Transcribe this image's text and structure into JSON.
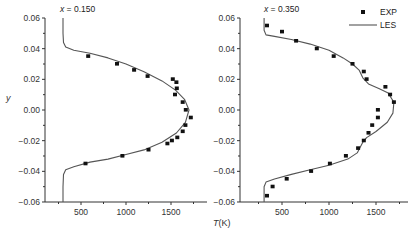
{
  "chart_data": [
    {
      "type": "line",
      "title": "x = 0.150",
      "title_italic_var": "x",
      "title_value": " = 0.150",
      "xlabel": "T(K)",
      "ylabel": "y",
      "xlim": [
        100,
        1900
      ],
      "ylim": [
        -0.06,
        0.06
      ],
      "xticks": [
        500,
        1000,
        1500
      ],
      "xtick_labels": [
        "500",
        "1000",
        "1500"
      ],
      "yticks": [
        0.06,
        0.04,
        0.02,
        0.0,
        -0.02,
        -0.04,
        -0.06
      ],
      "ytick_labels": [
        "0.06",
        "0.04",
        "0.02",
        "0.00",
        "−0.02",
        "−0.04",
        "−0.06"
      ],
      "grid": false,
      "series": [
        {
          "name": "EXP",
          "style": "square-markers",
          "points": [
            [
              580,
              0.035
            ],
            [
              900,
              0.03
            ],
            [
              1090,
              0.026
            ],
            [
              1240,
              0.022
            ],
            [
              1520,
              0.02
            ],
            [
              1560,
              0.018
            ],
            [
              1565,
              0.014
            ],
            [
              1545,
              0.01
            ],
            [
              1630,
              0.005
            ],
            [
              1665,
              0.0
            ],
            [
              1720,
              -0.005
            ],
            [
              1660,
              -0.01
            ],
            [
              1630,
              -0.014
            ],
            [
              1570,
              -0.018
            ],
            [
              1510,
              -0.02
            ],
            [
              1460,
              -0.022
            ],
            [
              1250,
              -0.026
            ],
            [
              960,
              -0.03
            ],
            [
              550,
              -0.035
            ]
          ]
        },
        {
          "name": "LES",
          "style": "solid-line",
          "points": [
            [
              300,
              0.06
            ],
            [
              300,
              0.05
            ],
            [
              305,
              0.044
            ],
            [
              330,
              0.041
            ],
            [
              420,
              0.039
            ],
            [
              600,
              0.037
            ],
            [
              800,
              0.034
            ],
            [
              1000,
              0.03
            ],
            [
              1200,
              0.025
            ],
            [
              1400,
              0.019
            ],
            [
              1550,
              0.013
            ],
            [
              1650,
              0.007
            ],
            [
              1700,
              0.0
            ],
            [
              1660,
              -0.008
            ],
            [
              1560,
              -0.015
            ],
            [
              1400,
              -0.021
            ],
            [
              1200,
              -0.026
            ],
            [
              1000,
              -0.029
            ],
            [
              800,
              -0.032
            ],
            [
              600,
              -0.034
            ],
            [
              420,
              -0.037
            ],
            [
              330,
              -0.039
            ],
            [
              305,
              -0.042
            ],
            [
              300,
              -0.05
            ],
            [
              300,
              -0.06
            ]
          ]
        }
      ]
    },
    {
      "type": "line",
      "title": "x = 0.350",
      "title_italic_var": "x",
      "title_value": " = 0.350",
      "xlabel": "T(K)",
      "ylabel": "y",
      "xlim": [
        100,
        1850
      ],
      "ylim": [
        -0.06,
        0.06
      ],
      "xticks": [
        500,
        1000,
        1500
      ],
      "xtick_labels": [
        "500",
        "1000",
        "1500"
      ],
      "yticks": [
        0.06,
        0.04,
        0.02,
        0.0,
        -0.02,
        -0.04,
        -0.06
      ],
      "ytick_labels": [
        "0.06",
        "0.04",
        "0.02",
        "0.00",
        "−0.02",
        "−0.04",
        "−0.06"
      ],
      "grid": false,
      "legend_position": "upper right",
      "series": [
        {
          "name": "EXP",
          "style": "square-markers",
          "points": [
            [
              340,
              0.055
            ],
            [
              500,
              0.051
            ],
            [
              650,
              0.045
            ],
            [
              870,
              0.04
            ],
            [
              1050,
              0.035
            ],
            [
              1250,
              0.03
            ],
            [
              1370,
              0.025
            ],
            [
              1400,
              0.02
            ],
            [
              1600,
              0.015
            ],
            [
              1650,
              0.01
            ],
            [
              1690,
              0.005
            ],
            [
              1520,
              0.0
            ],
            [
              1520,
              -0.005
            ],
            [
              1460,
              -0.01
            ],
            [
              1420,
              -0.015
            ],
            [
              1370,
              -0.02
            ],
            [
              1310,
              -0.025
            ],
            [
              1180,
              -0.03
            ],
            [
              1010,
              -0.035
            ],
            [
              810,
              -0.04
            ],
            [
              550,
              -0.045
            ],
            [
              400,
              -0.05
            ],
            [
              340,
              -0.056
            ]
          ]
        },
        {
          "name": "LES",
          "style": "solid-line",
          "points": [
            [
              310,
              0.06
            ],
            [
              310,
              0.052
            ],
            [
              330,
              0.049
            ],
            [
              420,
              0.048
            ],
            [
              600,
              0.046
            ],
            [
              800,
              0.043
            ],
            [
              1000,
              0.039
            ],
            [
              1150,
              0.034
            ],
            [
              1250,
              0.03
            ],
            [
              1320,
              0.026
            ],
            [
              1360,
              0.021
            ],
            [
              1420,
              0.017
            ],
            [
              1530,
              0.014
            ],
            [
              1630,
              0.011
            ],
            [
              1690,
              0.005
            ],
            [
              1680,
              -0.002
            ],
            [
              1620,
              -0.008
            ],
            [
              1500,
              -0.014
            ],
            [
              1400,
              -0.018
            ],
            [
              1360,
              -0.021
            ],
            [
              1300,
              -0.028
            ],
            [
              1200,
              -0.032
            ],
            [
              1000,
              -0.036
            ],
            [
              800,
              -0.039
            ],
            [
              600,
              -0.042
            ],
            [
              420,
              -0.045
            ],
            [
              330,
              -0.047
            ],
            [
              310,
              -0.05
            ],
            [
              310,
              -0.06
            ]
          ]
        }
      ]
    }
  ],
  "labels": {
    "ylabel": "y",
    "xlabel_var": "T",
    "xlabel_unit": "(K)",
    "panel1_var": "x",
    "panel1_value": " = 0.150",
    "panel2_var": "x",
    "panel2_value": " = 0.350",
    "legend_exp": "EXP",
    "legend_les": "LES"
  },
  "colors": {
    "line": "#555555",
    "marker": "#111111",
    "axis": "#333333"
  }
}
